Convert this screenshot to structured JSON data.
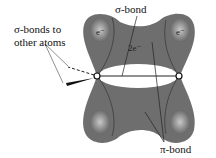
{
  "diagram": {
    "labels": {
      "sigma_bonds_other_line1": "σ-bonds to",
      "sigma_bonds_other_line2": "other atoms",
      "sigma_bond": "σ-bond",
      "pi_bond": "π-bond",
      "two_electrons": "2e⁻",
      "electron_left": "e⁻",
      "electron_right": "e⁻"
    },
    "colors": {
      "lobe_dark": "#6a6a6a",
      "lobe_light": "#b0b0b0",
      "background": "#ffffff",
      "lines": "#222222"
    }
  }
}
